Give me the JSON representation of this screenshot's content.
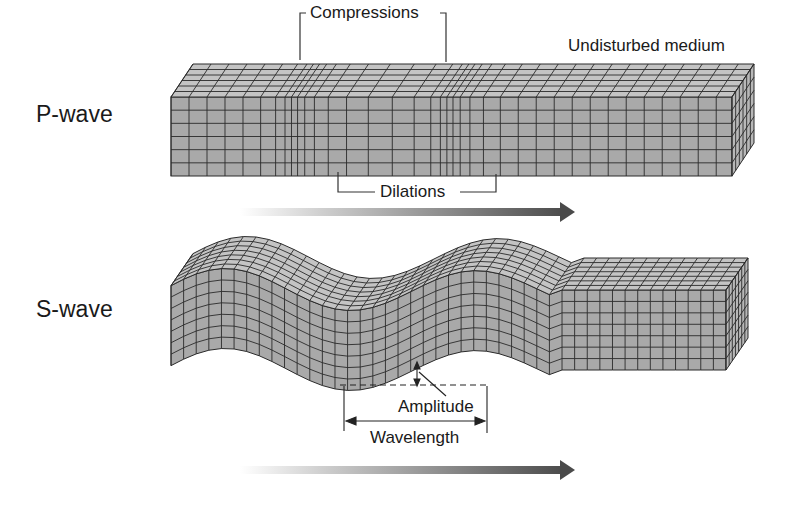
{
  "figure": {
    "p_wave": {
      "label": "P-wave",
      "annotations": {
        "compressions": "Compressions",
        "dilations": "Dilations",
        "undisturbed": "Undisturbed medium"
      }
    },
    "s_wave": {
      "label": "S-wave",
      "annotations": {
        "amplitude": "Amplitude",
        "wavelength": "Wavelength"
      }
    },
    "colors": {
      "face_front": "#a9a9a9",
      "face_top": "#c4c4c4",
      "face_side": "#b8b8b8",
      "grid_line": "#2a2a2a",
      "arrow_dark": "#555555",
      "arrow_light": "#e6e6e6"
    }
  }
}
